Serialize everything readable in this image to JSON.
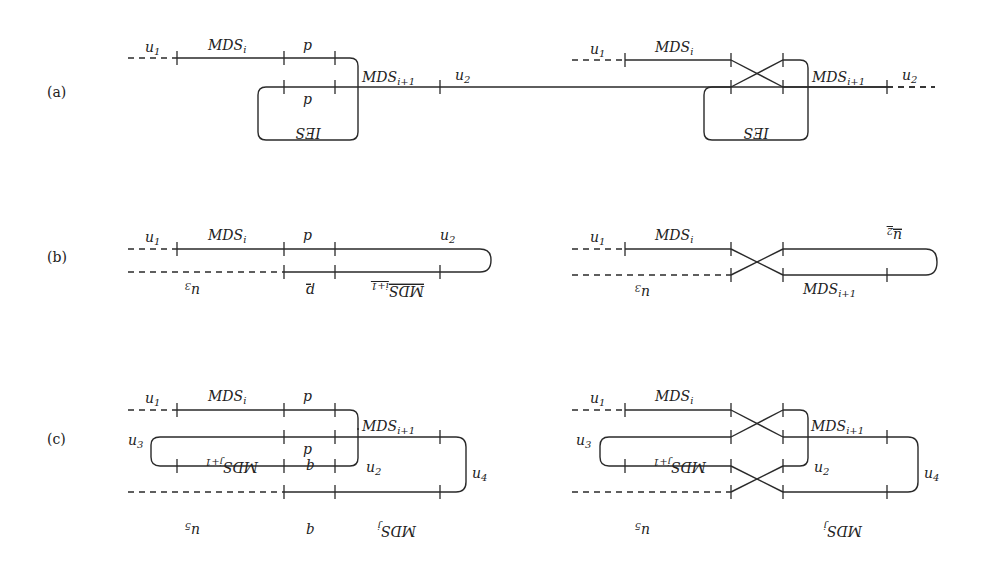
{
  "figure": {
    "panels": [
      {
        "id": "a",
        "label": "(a)",
        "left": {
          "labels": {
            "u1": "u",
            "u1_sub": "1",
            "mds_i": "MDS",
            "mds_i_sub": "i",
            "p_top": "p",
            "p_bottom": "p",
            "mds_i1": "MDS",
            "mds_i1_sub": "i+1",
            "u2": "u",
            "u2_sub": "2",
            "ies": "IES"
          }
        },
        "right": {
          "labels": {
            "u1": "u",
            "u1_sub": "1",
            "mds_i": "MDS",
            "mds_i_sub": "i",
            "mds_i1": "MDS",
            "mds_i1_sub": "i+1",
            "u2": "u",
            "u2_sub": "2",
            "ies": "IES"
          }
        }
      },
      {
        "id": "b",
        "label": "(b)",
        "left": {
          "labels": {
            "u1": "u",
            "u1_sub": "1",
            "mds_i": "MDS",
            "mds_i_sub": "i",
            "p_top": "p",
            "u2": "u",
            "u2_sub": "2",
            "u3": "u",
            "u3_sub": "3",
            "p_bottom": "p",
            "mds_i1": "MDS",
            "mds_i1_sub": "i+1"
          }
        },
        "right": {
          "labels": {
            "u1": "u",
            "u1_sub": "1",
            "mds_i": "MDS",
            "mds_i_sub": "i",
            "u2": "u",
            "u2_sub": "2",
            "u3": "u",
            "u3_sub": "3",
            "mds_i1": "MDS",
            "mds_i1_sub": "i+1"
          }
        }
      },
      {
        "id": "c",
        "label": "(c)",
        "left": {
          "labels": {
            "u1": "u",
            "u1_sub": "1",
            "mds_i": "MDS",
            "mds_i_sub": "i",
            "p_top": "p",
            "mds_i1": "MDS",
            "mds_i1_sub": "i+1",
            "u3": "u",
            "u3_sub": "3",
            "p_mid": "p",
            "mds_j1": "MDS",
            "mds_j1_sub": "j+1",
            "q_mid": "q",
            "u2": "u",
            "u2_sub": "2",
            "u4": "u",
            "u4_sub": "4",
            "u5": "u",
            "u5_sub": "5",
            "q_bottom": "q",
            "mds_j": "MDS",
            "mds_j_sub": "j"
          }
        },
        "right": {
          "labels": {
            "u1": "u",
            "u1_sub": "1",
            "mds_i": "MDS",
            "mds_i_sub": "i",
            "mds_i1": "MDS",
            "mds_i1_sub": "i+1",
            "u3": "u",
            "u3_sub": "3",
            "mds_j1": "MDS",
            "mds_j1_sub": "j+1",
            "u2": "u",
            "u2_sub": "2",
            "u4": "u",
            "u4_sub": "4",
            "u5": "u",
            "u5_sub": "5",
            "mds_j": "MDS",
            "mds_j_sub": "j"
          }
        }
      }
    ]
  }
}
